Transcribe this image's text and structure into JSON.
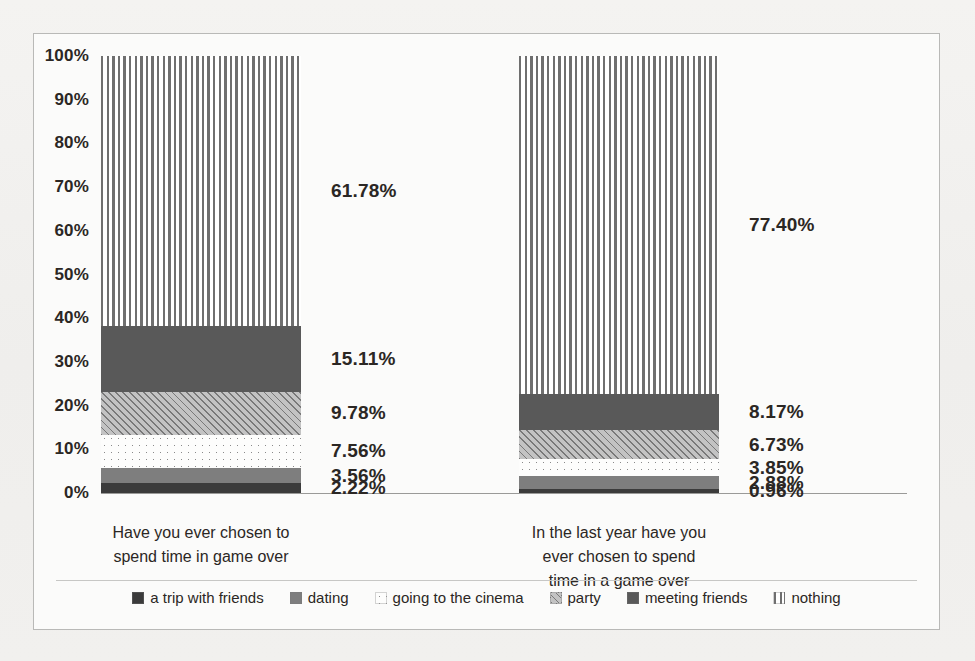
{
  "chart_data": {
    "type": "bar",
    "subtype": "100% stacked column",
    "title": "",
    "xlabel": "",
    "ylabel": "",
    "ylim": [
      0,
      100
    ],
    "grid": false,
    "legend_position": "bottom",
    "value_suffix": "%",
    "categories": [
      "Have you ever chosen to spend time in game over",
      "In the last year have you ever chosen to spend time in a game over"
    ],
    "category_lines": [
      [
        "Have you ever chosen to",
        "spend time in game over"
      ],
      [
        "In the last year have you",
        "ever chosen to spend",
        "time in a game over"
      ]
    ],
    "yticks": [
      "0%",
      "10%",
      "20%",
      "30%",
      "40%",
      "50%",
      "60%",
      "70%",
      "80%",
      "90%",
      "100%"
    ],
    "ytick_values": [
      0,
      10,
      20,
      30,
      40,
      50,
      60,
      70,
      80,
      90,
      100
    ],
    "series": [
      {
        "name": "a trip with friends",
        "pattern": "solid-dark",
        "color": "#3b3b3b",
        "values": [
          2.22,
          0.96
        ],
        "labels": [
          "2.22%",
          "0.96%"
        ]
      },
      {
        "name": "dating",
        "pattern": "solid-mid",
        "color": "#7e7e7e",
        "values": [
          3.56,
          2.88
        ],
        "labels": [
          "3.56%",
          "2.88%"
        ]
      },
      {
        "name": "going to the cinema",
        "pattern": "dots-light",
        "color": "#fdfdfc",
        "values": [
          7.56,
          3.85
        ],
        "labels": [
          "7.56%",
          "3.85%"
        ]
      },
      {
        "name": "party",
        "pattern": "diagonal-hatch",
        "color": "#c3c3c3",
        "values": [
          9.78,
          6.73
        ],
        "labels": [
          "9.78%",
          "6.73%"
        ]
      },
      {
        "name": "meeting friends",
        "pattern": "solid-darkgrey",
        "color": "#595959",
        "values": [
          15.11,
          8.17
        ],
        "labels": [
          "15.11%",
          "8.17%"
        ]
      },
      {
        "name": "nothing",
        "pattern": "vertical-stripes",
        "color": "#6f6f6f",
        "values": [
          61.78,
          77.4
        ],
        "labels": [
          "61.78%",
          "77.40%"
        ]
      }
    ]
  }
}
